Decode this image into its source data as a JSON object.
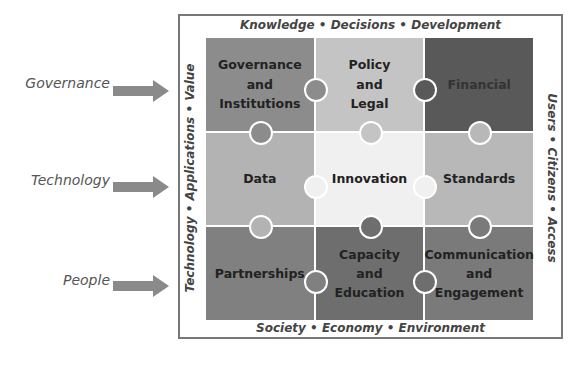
{
  "left_labels": [
    {
      "label": "Governance",
      "y": 84
    },
    {
      "label": "Technology",
      "y": 180
    },
    {
      "label": "People",
      "y": 280
    }
  ],
  "edges": {
    "top": "Knowledge  •  Decisions  •  Development",
    "bottom": "Society  •  Economy  •  Environment",
    "left": "Technology  •  Applications  •  Value",
    "right": "Users  •  Citizens  •  Access"
  },
  "pieces": [
    {
      "id": "governance-and-institutions",
      "lines": "Governance\nand\nInstitutions",
      "color": "#8c8c8c"
    },
    {
      "id": "policy-and-legal",
      "lines": "Policy\nand\nLegal",
      "color": "#c4c4c4"
    },
    {
      "id": "financial",
      "lines": "Financial",
      "color": "#595959"
    },
    {
      "id": "data",
      "lines": "Data",
      "color": "#b3b3b3"
    },
    {
      "id": "innovation",
      "lines": "Innovation",
      "color": "#f0f0f0"
    },
    {
      "id": "standards",
      "lines": "Standards",
      "color": "#b8b8b8"
    },
    {
      "id": "partnerships",
      "lines": "Partnerships",
      "color": "#808080"
    },
    {
      "id": "capacity-and-education",
      "lines": "Capacity\nand\nEducation",
      "color": "#6e6e6e"
    },
    {
      "id": "communication-and-engagement",
      "lines": "Communication\nand\nEngagement",
      "color": "#7a7a7a"
    }
  ]
}
